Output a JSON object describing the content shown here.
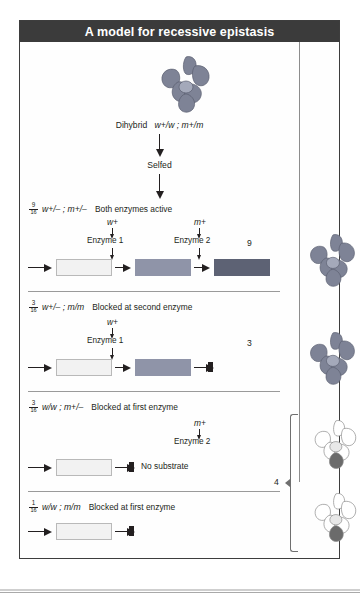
{
  "figure": {
    "title": "A model for recessive epistasis",
    "cross": {
      "parent_label": "Dihybrid",
      "parent_genotype": "w+/w ; m+/m",
      "selfed_label": "Selfed"
    },
    "rows": [
      {
        "fraction_num": "9",
        "fraction_den": "16",
        "genotype": "w+/– ; m+/–",
        "description": "Both enzymes active",
        "enzymes": [
          {
            "allele": "w+",
            "label": "Enzyme 1"
          },
          {
            "allele": "m+",
            "label": "Enzyme 2"
          }
        ],
        "count": "9",
        "blocked": false,
        "flower": "purple",
        "boxes": [
          "white",
          "medium",
          "dark"
        ]
      },
      {
        "fraction_num": "3",
        "fraction_den": "16",
        "genotype": "w+/– ; m/m",
        "description": "Blocked at second enzyme",
        "enzymes": [
          {
            "allele": "w+",
            "label": "Enzyme 1"
          }
        ],
        "count": "3",
        "blocked": true,
        "flower": "purple",
        "boxes": [
          "white",
          "medium"
        ]
      },
      {
        "fraction_num": "3",
        "fraction_den": "16",
        "genotype": "w/w ; m+/–",
        "description": "Blocked at first enzyme",
        "enzymes": [
          {
            "allele": "m+",
            "label": "Enzyme 2"
          }
        ],
        "count": "",
        "blocked": true,
        "no_substrate": "No substrate",
        "flower": "white",
        "boxes": [
          "white"
        ]
      },
      {
        "fraction_num": "1",
        "fraction_den": "16",
        "genotype": "w/w ; m/m",
        "description": "Blocked at first enzyme",
        "enzymes": [],
        "count": "",
        "blocked": true,
        "flower": "white",
        "boxes": [
          "white"
        ]
      }
    ],
    "bracket_count": "4",
    "colors": {
      "title_bar": "#3b3b3b",
      "box_white": "#f2f2f2",
      "box_medium": "#8f94a8",
      "box_dark": "#5d6274",
      "flower_purple": "#7e8396",
      "frame": "#3d3d3d"
    }
  }
}
